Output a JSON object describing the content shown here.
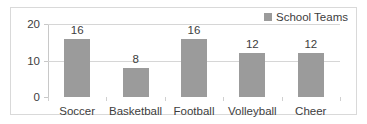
{
  "chart_data": {
    "type": "bar",
    "title": "",
    "xlabel": "",
    "ylabel": "",
    "categories": [
      "Soccer",
      "Basketball",
      "Football",
      "Volleyball",
      "Cheer"
    ],
    "values": [
      16,
      8,
      16,
      12,
      12
    ],
    "data_labels": [
      "16",
      "8",
      "16",
      "12",
      "12"
    ],
    "series": [
      {
        "name": "School Teams",
        "values": [
          16,
          8,
          16,
          12,
          12
        ]
      }
    ],
    "ylim": [
      0,
      20
    ],
    "yticks": [
      0,
      10,
      20
    ],
    "ytick_labels": [
      "0",
      "10",
      "20"
    ],
    "grid": true,
    "legend": {
      "position": "top-right",
      "entries": [
        "School Teams"
      ]
    },
    "colors": {
      "bar": "#9b9b9b",
      "grid": "#d6d6d6",
      "axis": "#c8c8c8",
      "text": "#3d3d3d",
      "border": "#d9d9d9",
      "background": "#ffffff"
    }
  },
  "legend": {
    "label": "School Teams",
    "swatch_name": "legend-color-swatch"
  }
}
